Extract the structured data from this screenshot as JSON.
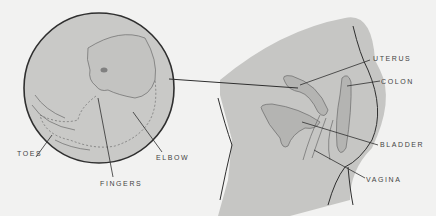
{
  "diagram": {
    "colors": {
      "background": "#f2f2f1",
      "circle_fill": "#c9c9c7",
      "body_fill": "#c6c6c4",
      "outline": "#2f2f2f",
      "organ_line": "#6a6a6a"
    },
    "embryo_labels": {
      "toes": "TOES",
      "fingers": "FINGERS",
      "elbow": "ELBOW"
    },
    "anatomy_labels": {
      "uterus": "UTERUS",
      "colon": "COLON",
      "bladder": "BLADDER",
      "vagina": "VAGINA"
    }
  }
}
